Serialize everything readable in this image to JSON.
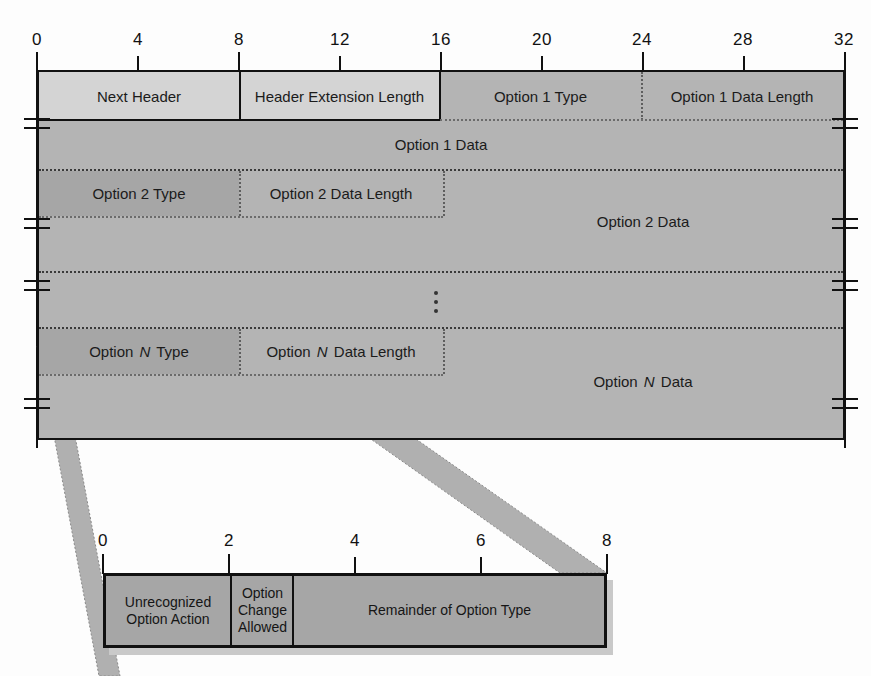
{
  "diagram": {
    "colors": {
      "field_light": "#d4d4d4",
      "field_mid": "#b4b4b4",
      "field_dark": "#a6a6a6",
      "outline": "#111111",
      "ribbon": "#b0b0b0"
    },
    "main_ruler": {
      "unit": "bits",
      "ticks": [
        "0",
        "4",
        "8",
        "12",
        "16",
        "20",
        "24",
        "28",
        "32"
      ],
      "min": 0,
      "max": 32
    },
    "rows": [
      {
        "name": "header-row",
        "fields": [
          {
            "label": "Next Header",
            "bits": 8,
            "shade": "light"
          },
          {
            "label": "Header Extension Length",
            "bits": 8,
            "shade": "light"
          },
          {
            "label": "Option 1 Type",
            "bits": 8,
            "shade": "mid"
          },
          {
            "label": "Option 1 Data Length",
            "bits": 8,
            "shade": "mid"
          }
        ]
      },
      {
        "name": "option1-data-row",
        "fields": [
          {
            "label": "Option 1 Data",
            "bits": 32,
            "shade": "mid"
          }
        ]
      },
      {
        "name": "option2-header-row",
        "fields": [
          {
            "label": "Option 2 Type",
            "bits": 8,
            "shade": "dark"
          },
          {
            "label": "Option 2 Data Length",
            "bits": 8,
            "shade": "mid"
          },
          {
            "label": "Option 2 Data",
            "bits": 16,
            "shade": "mid"
          }
        ]
      },
      {
        "name": "ellipsis-row",
        "fields": [
          {
            "label": "",
            "bits": 32,
            "shade": "mid"
          }
        ]
      },
      {
        "name": "optionN-header-row",
        "fields": [
          {
            "label": "Option N Type",
            "bits": 8,
            "shade": "dark"
          },
          {
            "label": "Option N Data Length",
            "bits": 8,
            "shade": "mid"
          },
          {
            "label": "Option N Data",
            "bits": 16,
            "shade": "mid"
          }
        ]
      }
    ],
    "labels": {
      "next_header": "Next Header",
      "header_extension_length": "Header Extension Length",
      "option1_type": "Option 1 Type",
      "option1_data_length": "Option 1 Data Length",
      "option1_data": "Option 1 Data",
      "option2_type": "Option 2 Type",
      "option2_data_length": "Option 2 Data Length",
      "option2_data": "Option 2 Data",
      "optionN_type_pre": "Option ",
      "optionN_type_italic": "N",
      "optionN_type_post": " Type",
      "optionN_len_pre": "Option ",
      "optionN_len_italic": "N",
      "optionN_len_post": " Data Length",
      "optionN_data_pre": "Option ",
      "optionN_data_italic": "N",
      "optionN_data_post": " Data",
      "continuation": "vertical-ellipsis"
    },
    "detail": {
      "caption": "Option Type byte breakdown",
      "ruler": {
        "unit": "bits",
        "ticks": [
          "0",
          "2",
          "4",
          "6",
          "8"
        ],
        "min": 0,
        "max": 8
      },
      "fields": [
        {
          "label": "Unrecognized Option Action",
          "lines": [
            "Unrecognized",
            "Option Action"
          ],
          "bits": 2
        },
        {
          "label": "Option Change Allowed",
          "lines": [
            "Option",
            "Change",
            "Allowed"
          ],
          "bits": 1
        },
        {
          "label": "Remainder of Option Type",
          "lines": [
            "Remainder of Option Type"
          ],
          "bits": 5
        }
      ]
    }
  }
}
